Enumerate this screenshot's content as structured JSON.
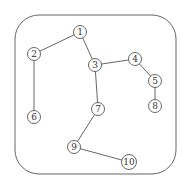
{
  "diagram": {
    "type": "undirected-graph",
    "frame": {
      "x": 15,
      "y": 15,
      "width": 161,
      "height": 159,
      "radius": 24,
      "stroke": "#666666"
    },
    "node_radius": 6.5,
    "colors": {
      "stroke": "#555555",
      "fill": "#ffffff",
      "edge": "#555555",
      "text": "#333333"
    },
    "nodes": [
      {
        "id": "1",
        "label": "1",
        "x": 80,
        "y": 32
      },
      {
        "id": "2",
        "label": "2",
        "x": 34,
        "y": 54
      },
      {
        "id": "3",
        "label": "3",
        "x": 95,
        "y": 65
      },
      {
        "id": "4",
        "label": "4",
        "x": 135,
        "y": 59
      },
      {
        "id": "5",
        "label": "5",
        "x": 155,
        "y": 81
      },
      {
        "id": "6",
        "label": "6",
        "x": 34,
        "y": 117
      },
      {
        "id": "7",
        "label": "7",
        "x": 98,
        "y": 109
      },
      {
        "id": "8",
        "label": "8",
        "x": 155,
        "y": 106
      },
      {
        "id": "9",
        "label": "9",
        "x": 74,
        "y": 147
      },
      {
        "id": "10",
        "label": "10",
        "x": 129,
        "y": 162
      }
    ],
    "edges": [
      {
        "from": "1",
        "to": "2"
      },
      {
        "from": "1",
        "to": "3"
      },
      {
        "from": "2",
        "to": "6"
      },
      {
        "from": "3",
        "to": "4"
      },
      {
        "from": "3",
        "to": "7"
      },
      {
        "from": "4",
        "to": "5"
      },
      {
        "from": "5",
        "to": "8"
      },
      {
        "from": "7",
        "to": "9"
      },
      {
        "from": "9",
        "to": "10"
      }
    ]
  }
}
